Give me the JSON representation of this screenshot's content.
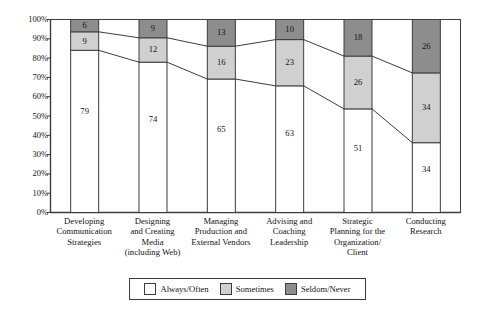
{
  "chart_data": {
    "type": "bar",
    "subtype": "stacked-percent-with-connectors",
    "title": "",
    "xlabel": "",
    "ylabel": "",
    "ylim": [
      0,
      100
    ],
    "yunit": "%",
    "grid": false,
    "legend_position": "bottom-center",
    "categories": [
      "Developing Communication Strategies",
      "Designing and Creating Media (including Web)",
      "Managing Production and External Vendors",
      "Advising and Coaching Leadership",
      "Strategic Planning for the Organization/Client",
      "Conducting Research"
    ],
    "category_lines": [
      [
        "Developing",
        "Communication",
        "Strategies"
      ],
      [
        "Designing",
        "and Creating",
        "Media",
        "(including Web)"
      ],
      [
        "Managing",
        "Production and",
        "External Vendors"
      ],
      [
        "Advising and",
        "Coaching",
        "Leadership"
      ],
      [
        "Strategic",
        "Planning for the",
        "Organization/",
        "Client"
      ],
      [
        "Conducting",
        "Research"
      ]
    ],
    "ytick_labels": [
      "100%",
      "90%",
      "80%",
      "70%",
      "60%",
      "50%",
      "40%",
      "30%",
      "20%",
      "10%",
      "0%"
    ],
    "ytick_values": [
      100,
      90,
      80,
      70,
      60,
      50,
      40,
      30,
      20,
      10,
      0
    ],
    "series": [
      {
        "name": "Always/Often",
        "color": "#ffffff",
        "values": [
          79,
          74,
          65,
          63,
          51,
          34
        ]
      },
      {
        "name": "Sometimes",
        "color": "#d0d0d0",
        "values": [
          9,
          12,
          16,
          23,
          26,
          34
        ]
      },
      {
        "name": "Seldom/Never",
        "color": "#8d8d8d",
        "values": [
          6,
          9,
          13,
          10,
          18,
          26
        ]
      }
    ]
  },
  "legend": {
    "items": [
      {
        "label": "Always/Often",
        "swatch_class": "sw-always"
      },
      {
        "label": "Sometimes",
        "swatch_class": "sw-sometimes"
      },
      {
        "label": "Seldom/Never",
        "swatch_class": "sw-seldom"
      }
    ]
  },
  "colors": {
    "always_often": "#ffffff",
    "sometimes": "#d0d0d0",
    "seldom_never": "#8d8d8d",
    "axis": "#3d3d3d",
    "text": "#141414",
    "background": "#ffffff"
  }
}
